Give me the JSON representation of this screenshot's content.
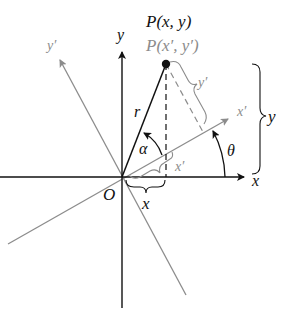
{
  "colors": {
    "primary": "#111111",
    "rotated": "#8c8c8c",
    "background": "#ffffff"
  },
  "labels": {
    "point": "P(x, y)",
    "point_rotated": "P(x′, y′)",
    "y_axis": "y",
    "x_axis": "x",
    "y_prime_axis": "y′",
    "x_prime_axis": "x′",
    "radius": "r",
    "alpha": "α",
    "theta": "θ",
    "origin": "O",
    "x_brace": "x",
    "y_brace": "y",
    "x_prime_brace": "x′",
    "y_prime_brace": "y′"
  }
}
